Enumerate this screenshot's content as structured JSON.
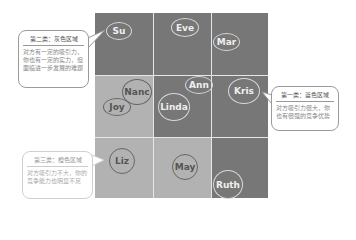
{
  "grid": {
    "rows": 3,
    "cols": 3,
    "cells": [
      {
        "row": 0,
        "col": 0,
        "shade": "dark"
      },
      {
        "row": 0,
        "col": 1,
        "shade": "dark"
      },
      {
        "row": 0,
        "col": 2,
        "shade": "dark"
      },
      {
        "row": 1,
        "col": 0,
        "shade": "light"
      },
      {
        "row": 1,
        "col": 1,
        "shade": "dark"
      },
      {
        "row": 1,
        "col": 2,
        "shade": "dark"
      },
      {
        "row": 2,
        "col": 0,
        "shade": "light"
      },
      {
        "row": 2,
        "col": 1,
        "shade": "light"
      },
      {
        "row": 2,
        "col": 2,
        "shade": "dark"
      }
    ],
    "colors": {
      "dark": "#777777",
      "light": "#b2b2b2",
      "divider": "#e6e6e6"
    }
  },
  "names": {
    "su": "Su",
    "eve": "Eve",
    "mar": "Mar",
    "nanc": "Nanc",
    "ann": "Ann",
    "joy": "Joy",
    "linda": "Linda",
    "kris": "Kris",
    "liz": "Liz",
    "may": "May",
    "ruth": "Ruth"
  },
  "callouts": {
    "gray": {
      "title": "第二类：灰色区域",
      "body": "对方有一定的吸引力，你也有一定的实力，但面临进一步发展的难题"
    },
    "blue": {
      "title": "第一类：蓝色区域",
      "body": "对方吸引力很大，你也有很强的竞争优势"
    },
    "orange": {
      "title": "第三类：橙色区域",
      "body": "对方吸引力不大，你的竞争能力也明显不足"
    }
  }
}
